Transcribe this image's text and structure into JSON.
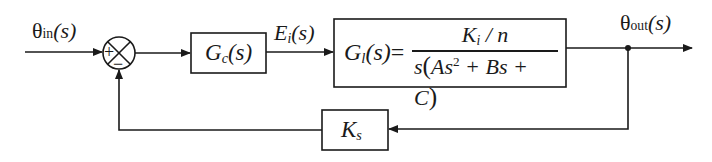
{
  "diagram": {
    "type": "control-system-block-diagram",
    "signals": {
      "input": {
        "symbol": "θ",
        "subscript": "in",
        "arg": "(s)"
      },
      "error": {
        "symbol": "E",
        "subscript": "i",
        "arg": "(s)"
      },
      "output": {
        "symbol": "θ",
        "subscript": "out",
        "arg": "(s)"
      }
    },
    "summing_junction": {
      "plus_sign": "+",
      "minus_sign": "−"
    },
    "blocks": {
      "controller": {
        "symbol": "G",
        "subscript": "c",
        "arg": "(s)"
      },
      "plant": {
        "lhs_symbol": "G",
        "lhs_subscript": "l",
        "lhs_arg": "(s)",
        "equals": "=",
        "numerator_symbol": "K",
        "numerator_subscript": "i",
        "numerator_rest": " / n",
        "denominator_prefix": "s",
        "denominator_open": "(",
        "denominator_term1": "As",
        "denominator_exp": "2",
        "denominator_term2": " + Bs + C",
        "denominator_close": ")"
      },
      "feedback": {
        "symbol": "K",
        "subscript": "s"
      }
    },
    "colors": {
      "line": "#1a1a1a",
      "background": "#ffffff"
    }
  }
}
